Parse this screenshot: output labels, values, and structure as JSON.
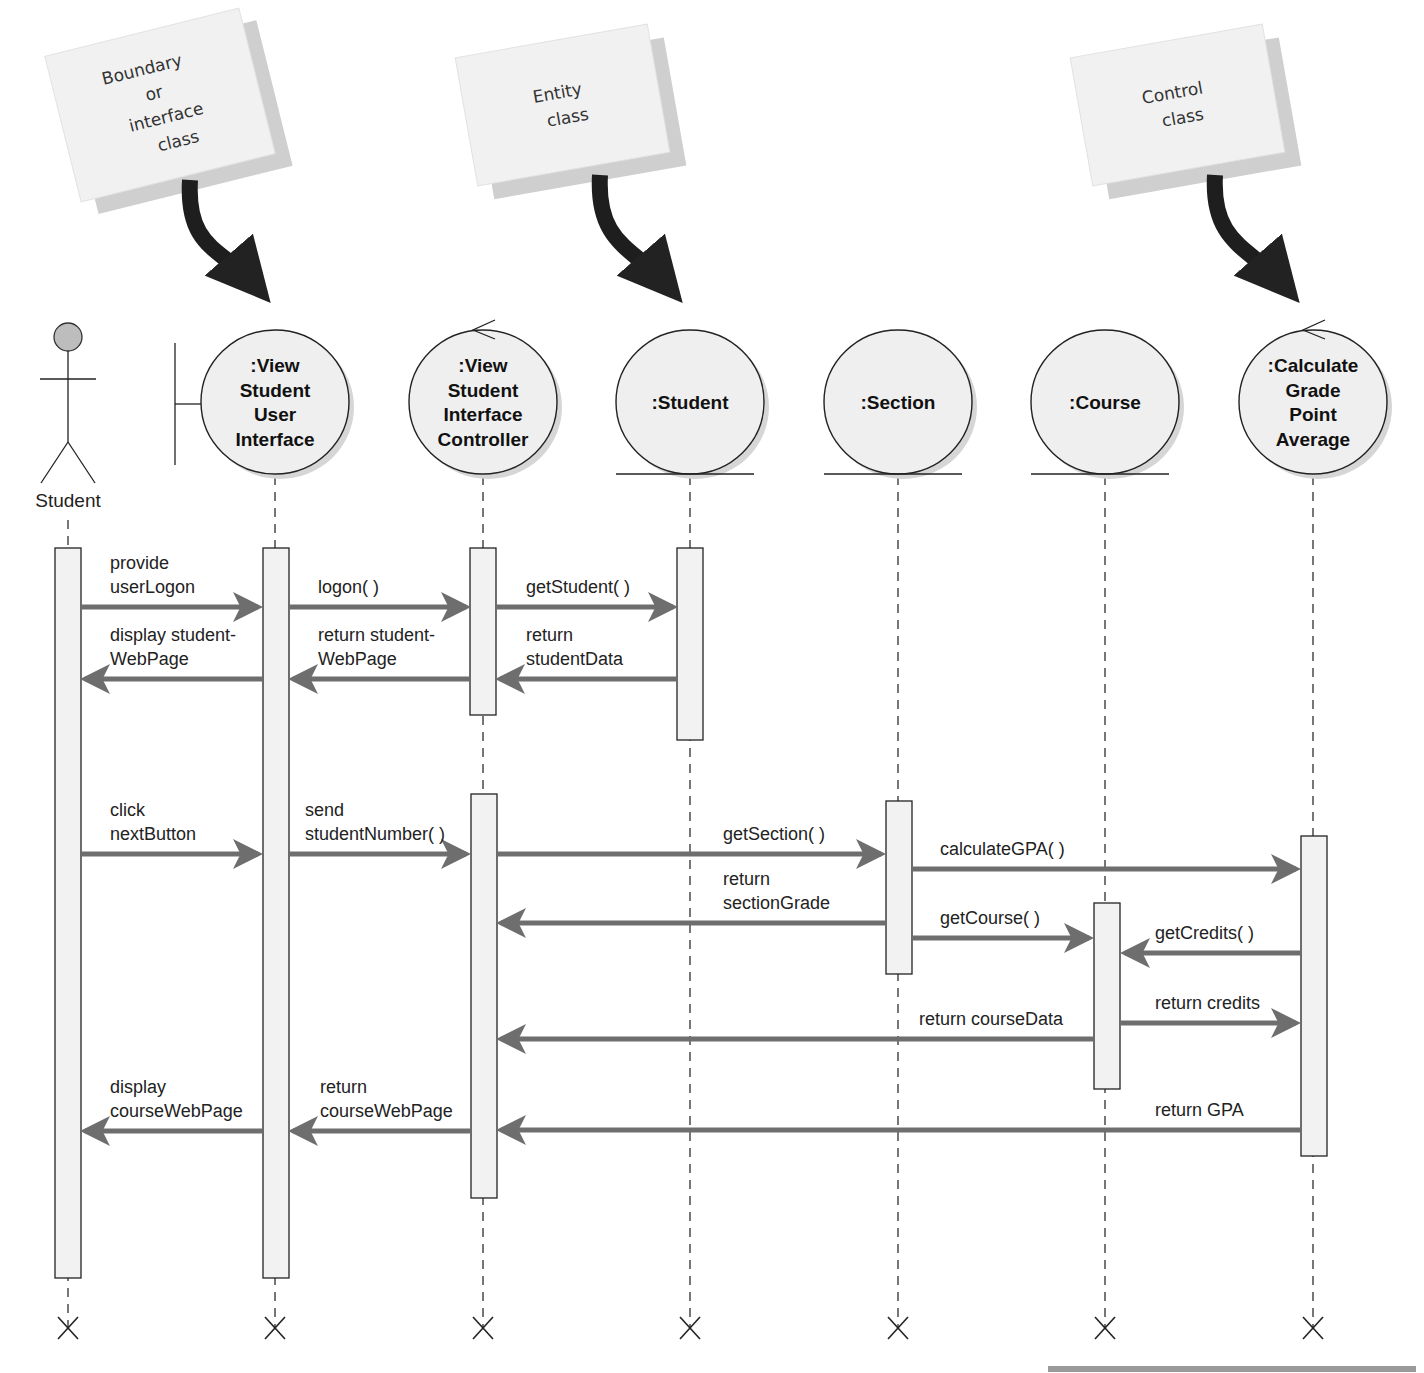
{
  "notes": [
    {
      "id": "boundary",
      "lines": [
        "Boundary",
        "or",
        "interface",
        "class"
      ],
      "x": 60,
      "y": 30,
      "w": 200,
      "h": 150,
      "rot": -14,
      "arrow_from": [
        190,
        180
      ],
      "arrow_to": [
        268,
        308
      ]
    },
    {
      "id": "entity",
      "lines": [
        "Entity",
        "class"
      ],
      "x": 465,
      "y": 40,
      "w": 195,
      "h": 130,
      "rot": -10,
      "arrow_from": [
        600,
        175
      ],
      "arrow_to": [
        680,
        308
      ]
    },
    {
      "id": "control",
      "lines": [
        "Control",
        "class"
      ],
      "x": 1080,
      "y": 40,
      "w": 195,
      "h": 130,
      "rot": -10,
      "arrow_from": [
        1215,
        175
      ],
      "arrow_to": [
        1297,
        308
      ]
    }
  ],
  "actor": {
    "label": "Student",
    "x": 68
  },
  "objects": [
    {
      "id": "view-ui",
      "type": "boundary",
      "x": 275,
      "lines": [
        ":View",
        "Student",
        "User",
        "Interface"
      ]
    },
    {
      "id": "view-controller",
      "type": "control",
      "x": 483,
      "lines": [
        ":View",
        "Student",
        "Interface",
        "Controller"
      ]
    },
    {
      "id": "student",
      "type": "entity",
      "x": 690,
      "lines": [
        ":Student"
      ]
    },
    {
      "id": "section",
      "type": "entity",
      "x": 898,
      "lines": [
        ":Section"
      ]
    },
    {
      "id": "course",
      "type": "entity",
      "x": 1105,
      "lines": [
        ":Course"
      ]
    },
    {
      "id": "calc-gpa",
      "type": "control",
      "x": 1313,
      "lines": [
        ":Calculate",
        "Grade",
        "Point",
        "Average"
      ]
    }
  ],
  "activations": [
    {
      "x": 68,
      "y1": 548,
      "y2": 1278
    },
    {
      "x": 276,
      "y1": 548,
      "y2": 1278
    },
    {
      "x": 483,
      "y1": 548,
      "y2": 715
    },
    {
      "x": 690,
      "y1": 548,
      "y2": 740
    },
    {
      "x": 484,
      "y1": 794,
      "y2": 1198
    },
    {
      "x": 899,
      "y1": 801,
      "y2": 974
    },
    {
      "x": 1107,
      "y1": 903,
      "y2": 1089
    },
    {
      "x": 1314,
      "y1": 836,
      "y2": 1156
    }
  ],
  "messages": [
    {
      "label": [
        "provide",
        "userLogon"
      ],
      "from": 81,
      "to": 262,
      "y": 607,
      "lx": 110
    },
    {
      "label": [
        "logon( )"
      ],
      "from": 289,
      "to": 470,
      "y": 607,
      "lx": 318
    },
    {
      "label": [
        "getStudent( )"
      ],
      "from": 496,
      "to": 677,
      "y": 607,
      "lx": 526
    },
    {
      "label": [
        "display student-",
        "WebPage"
      ],
      "from": 262,
      "to": 81,
      "y": 679,
      "lx": 110
    },
    {
      "label": [
        "return student-",
        "WebPage"
      ],
      "from": 470,
      "to": 289,
      "y": 679,
      "lx": 318
    },
    {
      "label": [
        "return",
        "studentData"
      ],
      "from": 677,
      "to": 496,
      "y": 679,
      "lx": 526
    },
    {
      "label": [
        "click",
        "nextButton"
      ],
      "from": 81,
      "to": 262,
      "y": 854,
      "lx": 110
    },
    {
      "label": [
        "send",
        "studentNumber( )"
      ],
      "from": 289,
      "to": 470,
      "y": 854,
      "lx": 305
    },
    {
      "label": [
        "getSection( )"
      ],
      "from": 497,
      "to": 885,
      "y": 854,
      "lx": 723
    },
    {
      "label": [
        "calculateGPA( )"
      ],
      "from": 912,
      "to": 1300,
      "y": 869,
      "lx": 940
    },
    {
      "label": [
        "return",
        "sectionGrade"
      ],
      "from": 885,
      "to": 497,
      "y": 923,
      "lx": 723
    },
    {
      "label": [
        "getCourse( )"
      ],
      "from": 912,
      "to": 1093,
      "y": 938,
      "lx": 940
    },
    {
      "label": [
        "getCredits( )"
      ],
      "from": 1300,
      "to": 1121,
      "y": 953,
      "lx": 1155
    },
    {
      "label": [
        "return credits"
      ],
      "from": 1121,
      "to": 1300,
      "y": 1023,
      "lx": 1155
    },
    {
      "label": [
        "return courseData"
      ],
      "from": 1093,
      "to": 497,
      "y": 1039,
      "lx": 919
    },
    {
      "label": [
        "display",
        "courseWebPage"
      ],
      "from": 262,
      "to": 81,
      "y": 1131,
      "lx": 110
    },
    {
      "label": [
        "return",
        "courseWebPage"
      ],
      "from": 470,
      "to": 289,
      "y": 1131,
      "lx": 320
    },
    {
      "label": [
        "return GPA"
      ],
      "from": 1300,
      "to": 497,
      "y": 1130,
      "lx": 1155
    }
  ],
  "destroy_y": 1328,
  "colors": {
    "arrow": "#6e6e6e",
    "note": "#f1f1f1",
    "note_shadow": "#cfcfcf",
    "object_fill": "#efefef",
    "actor_head": "#bdbdbd"
  }
}
